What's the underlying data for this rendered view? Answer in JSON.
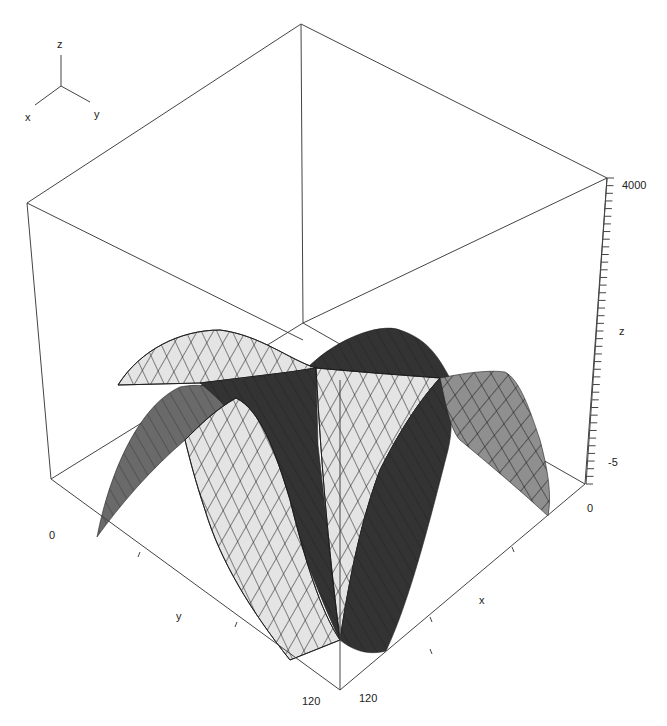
{
  "chart_data": {
    "type": "surface3d",
    "title": "",
    "xlabel": "x",
    "ylabel": "y",
    "zlabel": "z",
    "x_range": [
      0,
      120
    ],
    "y_range": [
      0,
      120
    ],
    "z_range": [
      -5,
      4000
    ],
    "x_ticks": [
      "0",
      "120"
    ],
    "y_ticks": [
      "0",
      "120"
    ],
    "z_ticks": [
      "-5",
      "4000"
    ],
    "orientation_gizmo": {
      "x": "x",
      "y": "y",
      "z": "z"
    },
    "colors": {
      "light_face": "#e4e4e4",
      "mid_face": "#8a8a8a",
      "medium_dark_face": "#6e6e6e",
      "dark_face": "#333333",
      "mesh_line": "#1a1a1a",
      "box_line": "#444444"
    }
  },
  "labels": {
    "gizmo_x": "x",
    "gizmo_y": "y",
    "gizmo_z": "z",
    "z_top": "4000",
    "z_axis": "z",
    "z_bottom": "-5",
    "right_zero": "0",
    "left_zero": "0",
    "y_axis": "y",
    "x_axis": "x",
    "y_end": "120",
    "x_end": "120"
  }
}
